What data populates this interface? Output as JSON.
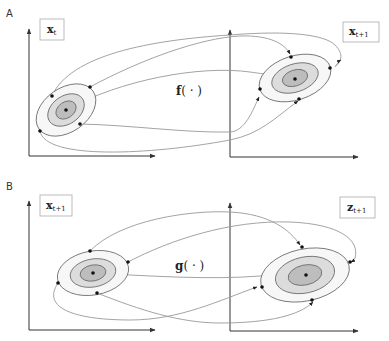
{
  "figure": {
    "panels": [
      {
        "id": "A",
        "label": "A",
        "input_var": {
          "base": "x",
          "sub": "t"
        },
        "output_var": {
          "base": "x",
          "sub": "t+1"
        },
        "function": {
          "name": "f",
          "arg": "( · )"
        }
      },
      {
        "id": "B",
        "label": "B",
        "input_var": {
          "base": "x",
          "sub": "t+1"
        },
        "output_var": {
          "base": "z",
          "sub": "t+1"
        },
        "function": {
          "name": "g",
          "arg": "( · )"
        }
      }
    ],
    "colors": {
      "ring_outer": "#f7f7f7",
      "ring_mid": "#dcdcdc",
      "ring_inner": "#bdbdbd",
      "curve": "#999999",
      "axis": "#333333",
      "point": "#111111"
    }
  }
}
